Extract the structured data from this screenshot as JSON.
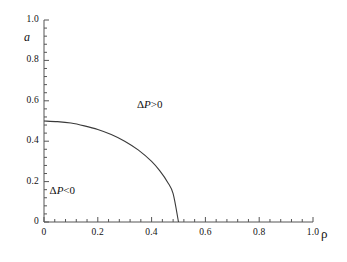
{
  "chart_data": {
    "type": "line",
    "title": "",
    "xlabel": "ρ",
    "ylabel": "a",
    "xlim": [
      0,
      1.0
    ],
    "ylim": [
      0,
      1.0
    ],
    "grid": false,
    "legend": null,
    "x_ticks": [
      "0",
      "0.2",
      "0.4",
      "0.6",
      "0.8",
      "1.0"
    ],
    "x_tick_values": [
      0,
      0.2,
      0.4,
      0.6,
      0.8,
      1.0
    ],
    "y_ticks": [
      "0",
      "0.2",
      "0.4",
      "0.6",
      "0.8",
      "1.0"
    ],
    "y_tick_values": [
      0,
      0.2,
      0.4,
      0.6,
      0.8,
      1.0
    ],
    "minor_ticks_per_interval": 4,
    "tick_direction": "in",
    "series": [
      {
        "name": "phase-boundary",
        "color": "#3a3a3a",
        "x": [
          0.0,
          0.05,
          0.1,
          0.15,
          0.2,
          0.25,
          0.3,
          0.35,
          0.4,
          0.43,
          0.46,
          0.48,
          0.5
        ],
        "y": [
          0.5,
          0.497,
          0.49,
          0.476,
          0.458,
          0.433,
          0.4,
          0.357,
          0.3,
          0.254,
          0.196,
          0.14,
          0.0
        ]
      }
    ],
    "annotations": [
      {
        "name": "delta-p-positive",
        "text": "ΔP>0",
        "x": 0.42,
        "y": 0.58
      },
      {
        "name": "delta-p-negative",
        "text": "ΔP<0",
        "x": 0.095,
        "y": 0.155
      }
    ]
  },
  "axis": {
    "y_label": "a",
    "x_label": "ρ",
    "x_tick_labels": [
      "0",
      "0.2",
      "0.4",
      "0.6",
      "0.8",
      "1.0"
    ],
    "y_tick_labels": [
      "0",
      "0.2",
      "0.4",
      "0.6",
      "0.8",
      "1.0"
    ]
  },
  "regions": {
    "positive_label": "ΔP>0",
    "negative_label": "ΔP<0"
  },
  "colors": {
    "background": "#ffffff",
    "axis": "#555555",
    "curve": "#3a3a3a",
    "text": "#111111"
  }
}
